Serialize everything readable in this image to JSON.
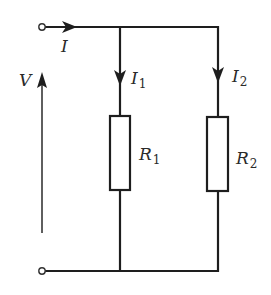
{
  "diagram": {
    "type": "parallel-resistor-circuit",
    "labels": {
      "supply_current": "I",
      "voltage": "V",
      "branch1_current_main": "I",
      "branch1_current_sub": "1",
      "branch2_current_main": "I",
      "branch2_current_sub": "2",
      "resistor1_main": "R",
      "resistor1_sub": "1",
      "resistor2_main": "R",
      "resistor2_sub": "2"
    },
    "components": [
      {
        "id": "R1",
        "kind": "resistor",
        "branch": 1
      },
      {
        "id": "R2",
        "kind": "resistor",
        "branch": 2
      }
    ],
    "terminals": [
      "top-terminal",
      "bottom-terminal"
    ],
    "colors": {
      "line": "#1e1e1e",
      "background": "#ffffff"
    }
  }
}
